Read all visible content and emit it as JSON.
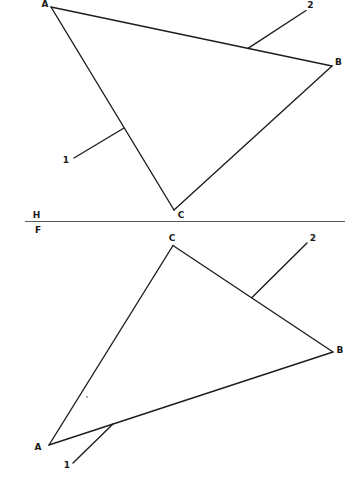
{
  "canvas": {
    "width": 349,
    "height": 486,
    "background": "#ffffff"
  },
  "style": {
    "line_color": "#1e1e1e",
    "line_width": 1.4,
    "fold_line_color": "#5a5a5a",
    "fold_line_width": 1.2,
    "label_color": "#1a1a1a",
    "font_size": 9,
    "mark_color": "#8a8a8a"
  },
  "fold_line": {
    "x1": 25,
    "x2": 345,
    "y": 221.5,
    "labels": [
      {
        "text": "H",
        "x": 36.5,
        "y": 217.5
      },
      {
        "text": "F",
        "x": 38,
        "y": 232.5
      }
    ]
  },
  "views": [
    {
      "id": "top-view",
      "vertices": [
        {
          "label": "A",
          "x": 51,
          "y": 7,
          "label_x": 45,
          "label_y": 6.5
        },
        {
          "label": "B",
          "x": 332,
          "y": 66,
          "label_x": 338.5,
          "label_y": 65
        },
        {
          "label": "C",
          "x": 174,
          "y": 210,
          "label_x": 181,
          "label_y": 217.5
        }
      ],
      "edges": [
        [
          0,
          1
        ],
        [
          1,
          2
        ],
        [
          2,
          0
        ]
      ],
      "construction_lines": [
        {
          "label": "2",
          "x1": 248,
          "y1": 48.4,
          "x2": 306,
          "y2": 10.5,
          "label_x": 310.5,
          "label_y": 8
        },
        {
          "label": "1",
          "x1": 124,
          "y1": 128,
          "x2": 74,
          "y2": 158,
          "label_x": 66,
          "label_y": 163
        }
      ],
      "marks": []
    },
    {
      "id": "front-view",
      "vertices": [
        {
          "label": "C",
          "x": 173,
          "y": 245.5,
          "label_x": 172,
          "label_y": 240.5
        },
        {
          "label": "B",
          "x": 333,
          "y": 352,
          "label_x": 340,
          "label_y": 353
        },
        {
          "label": "A",
          "x": 49,
          "y": 445,
          "label_x": 38,
          "label_y": 449.5
        }
      ],
      "edges": [
        [
          0,
          1
        ],
        [
          1,
          2
        ],
        [
          2,
          0
        ]
      ],
      "construction_lines": [
        {
          "label": "2",
          "x1": 252,
          "y1": 297.5,
          "x2": 307,
          "y2": 243,
          "label_x": 313,
          "label_y": 240.5
        },
        {
          "label": "1",
          "x1": 113,
          "y1": 424,
          "x2": 73,
          "y2": 463,
          "label_x": 67,
          "label_y": 468
        }
      ],
      "marks": [
        {
          "type": "dot",
          "x": 87,
          "y": 397,
          "r": 0.9
        }
      ]
    }
  ]
}
